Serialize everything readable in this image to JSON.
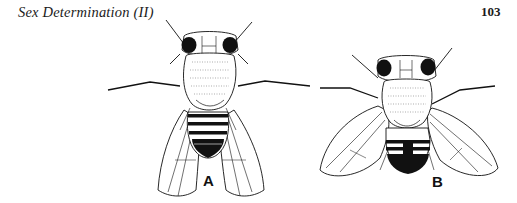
{
  "page": {
    "running_head": "Sex Determination (II)",
    "page_number": "103"
  },
  "figure": {
    "panels": [
      {
        "id": "A",
        "label": "A",
        "subject": "fly-illustration-female"
      },
      {
        "id": "B",
        "label": "B",
        "subject": "fly-illustration-male"
      }
    ],
    "colors": {
      "ink": "#111111",
      "paper": "#ffffff"
    }
  }
}
